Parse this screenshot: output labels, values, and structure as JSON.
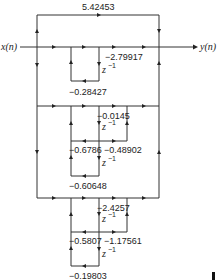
{
  "diagram": {
    "type": "signal-flow-graph",
    "input_label": "x(n)",
    "output_label": "y(n)",
    "feedforward_gain": "5.42453",
    "section1": {
      "gain_out": "−2.79917",
      "delay": "z",
      "delay_exp": "−1",
      "feedback": "−0.28427"
    },
    "section2": {
      "gain_a": "−0.0145",
      "delay1": "z",
      "delay1_exp": "−1",
      "feedback1": "−0.6786",
      "gain_b": "−0.48902",
      "delay2": "z",
      "delay2_exp": "−1",
      "feedback2": "−0.60648"
    },
    "section3": {
      "gain_a": "−2.4257",
      "delay1": "z",
      "delay1_exp": "−1",
      "feedback1": "−0.5807",
      "gain_b": "−1.17561",
      "delay2": "z",
      "delay2_exp": "−1",
      "feedback2": "−0.19803"
    }
  }
}
